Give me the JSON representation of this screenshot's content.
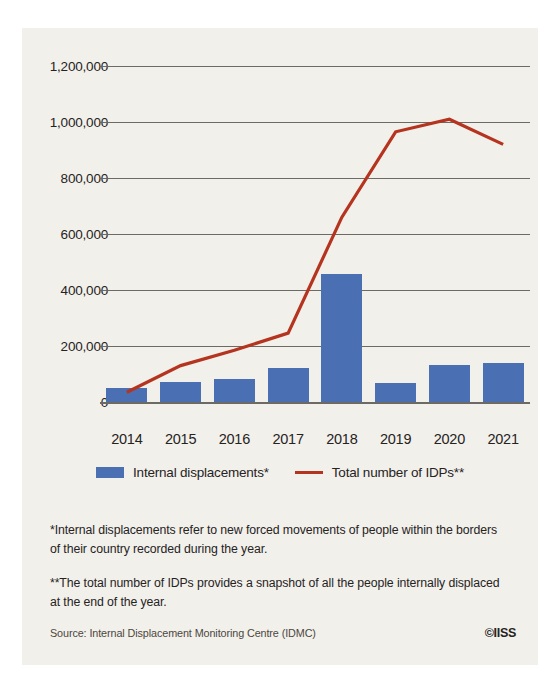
{
  "page": {
    "top_sliver_text": "",
    "background_color": "#f2f0ea"
  },
  "chart_data": {
    "type": "bar",
    "title": "",
    "xlabel": "",
    "ylabel": "",
    "categories": [
      "2014",
      "2015",
      "2016",
      "2017",
      "2018",
      "2019",
      "2020",
      "2021"
    ],
    "ylim": [
      0,
      1200000
    ],
    "ytick_labels": [
      "1,200,000",
      "1,000,000",
      "800,000",
      "600,000",
      "400,000",
      "200,000",
      "0"
    ],
    "yticks": [
      1200000,
      1000000,
      800000,
      600000,
      400000,
      200000,
      0
    ],
    "grid": true,
    "legend_position": "bottom-center",
    "series": [
      {
        "name": "Internal displacements*",
        "type": "bar",
        "color": "#4a6fb2",
        "values": [
          49000,
          70000,
          82000,
          120000,
          458000,
          67000,
          131000,
          140000
        ]
      },
      {
        "name": "Total number of IDPs**",
        "type": "line",
        "color": "#b5341f",
        "values": [
          35000,
          130000,
          185000,
          246000,
          660000,
          965000,
          1010000,
          920000
        ]
      }
    ]
  },
  "legend": {
    "items": [
      {
        "label": "Internal displacements*",
        "marker": "bar-swatch",
        "color": "#4a6fb2"
      },
      {
        "label": "Total number of IDPs**",
        "marker": "line-swatch",
        "color": "#b5341f"
      }
    ]
  },
  "notes": [
    "*Internal displacements refer to new forced movements of people within the borders of their country recorded during the year.",
    "**The total number of IDPs provides a snapshot of all the people internally displaced at the end of the year."
  ],
  "footer": {
    "source": "Source: Internal Displacement Monitoring Centre (IDMC)",
    "credit": "©IISS"
  }
}
